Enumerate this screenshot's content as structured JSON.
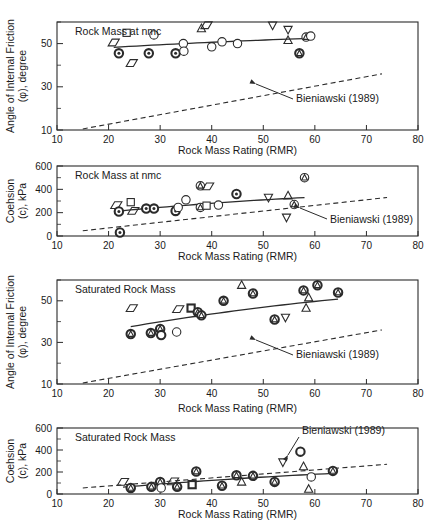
{
  "figure": {
    "xlabel": "Rock Mass Rating (RMR)",
    "xlim": [
      10,
      80
    ],
    "xticks": [
      10,
      20,
      30,
      40,
      50,
      60,
      70,
      80
    ],
    "annotation_label": "Bieniawski (1989)"
  },
  "panels": [
    {
      "id": "panel-1",
      "title": "Rock Mass at nmc",
      "ylabel_line1": "Angle of Internal Friction",
      "ylabel_line2": "(φ), degree",
      "ylim": [
        10,
        60
      ],
      "yticks": [
        10,
        30,
        50
      ],
      "yticks_minor": [
        20,
        40,
        60
      ],
      "annotation": "Bieniawski (1989)"
    },
    {
      "id": "panel-2",
      "title": "Rock Mass at nmc",
      "ylabel_line1": "Coehsion",
      "ylabel_line2": "(c), kPa",
      "ylim": [
        0,
        600
      ],
      "yticks": [
        0,
        200,
        400,
        600
      ],
      "yticks_minor": [
        100,
        300,
        500
      ],
      "annotation": "Bieniawski (1989)"
    },
    {
      "id": "panel-3",
      "title": "Saturated Rock Mass",
      "ylabel_line1": "Angle of Internal Friction",
      "ylabel_line2": "(φ), degree",
      "ylim": [
        10,
        60
      ],
      "yticks": [
        10,
        30,
        50
      ],
      "yticks_minor": [
        20,
        40,
        60
      ],
      "annotation": "Bieniawski (1989)"
    },
    {
      "id": "panel-4",
      "title": "Saturated Rock Mass",
      "ylabel_line1": "Coehsion",
      "ylabel_line2": "(c), kPa",
      "ylim": [
        0,
        600
      ],
      "yticks": [
        0,
        200,
        400,
        600
      ],
      "yticks_minor": [
        100,
        300,
        500
      ],
      "annotation": "Bieniawski (1989)"
    }
  ],
  "chart_data": [
    {
      "type": "scatter",
      "title": "Rock Mass at nmc",
      "xlabel": "Rock Mass Rating (RMR)",
      "ylabel": "Angle of Internal Friction (φ), degree",
      "xlim": [
        10,
        80
      ],
      "ylim": [
        10,
        60
      ],
      "xticks": [
        10,
        20,
        30,
        40,
        50,
        60,
        70,
        80
      ],
      "yticks": [
        10,
        30,
        50
      ],
      "grid": false,
      "legend": "none",
      "points": [
        {
          "x": 21.0,
          "y": 50.5,
          "marker": "parallelogram"
        },
        {
          "x": 23.5,
          "y": 55.0,
          "marker": "square"
        },
        {
          "x": 22.0,
          "y": 45.5,
          "marker": "circle-dot-bold"
        },
        {
          "x": 24.5,
          "y": 41.0,
          "marker": "parallelogram"
        },
        {
          "x": 28.8,
          "y": 54.0,
          "marker": "circle"
        },
        {
          "x": 27.8,
          "y": 45.5,
          "marker": "circle-dot-bold"
        },
        {
          "x": 33.0,
          "y": 45.5,
          "marker": "circle-dot-bold"
        },
        {
          "x": 34.5,
          "y": 50.0,
          "marker": "circle"
        },
        {
          "x": 34.6,
          "y": 46.5,
          "marker": "circle"
        },
        {
          "x": 38.0,
          "y": 57.0,
          "marker": "triangle-up"
        },
        {
          "x": 39.0,
          "y": 58.5,
          "marker": "parallelogram"
        },
        {
          "x": 40.0,
          "y": 48.5,
          "marker": "circle"
        },
        {
          "x": 42.0,
          "y": 50.8,
          "marker": "circle"
        },
        {
          "x": 45.0,
          "y": 50.0,
          "marker": "circle"
        },
        {
          "x": 51.8,
          "y": 58.5,
          "marker": "triangle-down"
        },
        {
          "x": 54.8,
          "y": 56.5,
          "marker": "triangle-down"
        },
        {
          "x": 54.8,
          "y": 51.5,
          "marker": "triangle-up"
        },
        {
          "x": 57.0,
          "y": 45.5,
          "marker": "circle-triangle-bold"
        },
        {
          "x": 58.3,
          "y": 53.0,
          "marker": "circle-triangle"
        },
        {
          "x": 59.2,
          "y": 53.5,
          "marker": "circle"
        }
      ],
      "fit_curve": {
        "name": "best-fit",
        "style": "solid"
      },
      "reference_line": {
        "name": "Bieniawski (1989)",
        "style": "dashed",
        "x": [
          15,
          73
        ],
        "y": [
          10.5,
          36.0
        ]
      }
    },
    {
      "type": "scatter",
      "title": "Rock Mass at nmc",
      "xlabel": "Rock Mass Rating (RMR)",
      "ylabel": "Coehsion (c), kPa",
      "xlim": [
        10,
        80
      ],
      "ylim": [
        0,
        600
      ],
      "xticks": [
        10,
        20,
        30,
        40,
        50,
        60,
        70,
        80
      ],
      "yticks": [
        0,
        200,
        400,
        600
      ],
      "grid": false,
      "legend": "none",
      "points": [
        {
          "x": 21.5,
          "y": 265,
          "marker": "parallelogram"
        },
        {
          "x": 24.3,
          "y": 290,
          "marker": "square"
        },
        {
          "x": 22.0,
          "y": 210,
          "marker": "circle-dot-bold"
        },
        {
          "x": 24.8,
          "y": 215,
          "marker": "parallelogram"
        },
        {
          "x": 22.2,
          "y": 30,
          "marker": "circle-dot-bold"
        },
        {
          "x": 27.3,
          "y": 235,
          "marker": "circle-dot-bold"
        },
        {
          "x": 28.8,
          "y": 235,
          "marker": "circle-dot-bold"
        },
        {
          "x": 33.0,
          "y": 215,
          "marker": "circle-dot-bold"
        },
        {
          "x": 33.5,
          "y": 245,
          "marker": "circle"
        },
        {
          "x": 35.0,
          "y": 310,
          "marker": "circle"
        },
        {
          "x": 37.8,
          "y": 430,
          "marker": "circle-triangle"
        },
        {
          "x": 39.3,
          "y": 425,
          "marker": "parallelogram"
        },
        {
          "x": 37.8,
          "y": 245,
          "marker": "circle-triangle"
        },
        {
          "x": 39.0,
          "y": 260,
          "marker": "square"
        },
        {
          "x": 41.3,
          "y": 265,
          "marker": "circle"
        },
        {
          "x": 44.8,
          "y": 360,
          "marker": "circle-dot-bold"
        },
        {
          "x": 51.0,
          "y": 330,
          "marker": "triangle-down"
        },
        {
          "x": 54.8,
          "y": 345,
          "marker": "triangle-up"
        },
        {
          "x": 54.5,
          "y": 160,
          "marker": "triangle-down"
        },
        {
          "x": 56.0,
          "y": 270,
          "marker": "circle-triangle"
        },
        {
          "x": 58.0,
          "y": 500,
          "marker": "circle-triangle"
        }
      ],
      "fit_curve": {
        "name": "best-fit",
        "style": "solid"
      },
      "reference_line": {
        "name": "Bieniawski (1989)",
        "style": "dashed",
        "x": [
          15,
          74
        ],
        "y": [
          45,
          330
        ]
      }
    },
    {
      "type": "scatter",
      "title": "Saturated Rock Mass",
      "xlabel": "Rock Mass Rating (RMR)",
      "ylabel": "Angle of Internal Friction (φ), degree",
      "xlim": [
        10,
        80
      ],
      "ylim": [
        10,
        60
      ],
      "xticks": [
        10,
        20,
        30,
        40,
        50,
        60,
        70,
        80
      ],
      "yticks": [
        10,
        30,
        50
      ],
      "grid": false,
      "legend": "none",
      "points": [
        {
          "x": 24.5,
          "y": 46.5,
          "marker": "parallelogram"
        },
        {
          "x": 24.3,
          "y": 34.0,
          "marker": "circle-triangle-bold"
        },
        {
          "x": 28.2,
          "y": 34.5,
          "marker": "circle-triangle-bold"
        },
        {
          "x": 30.0,
          "y": 36.5,
          "marker": "circle-triangle-bold"
        },
        {
          "x": 30.2,
          "y": 33.5,
          "marker": "circle-bold"
        },
        {
          "x": 33.2,
          "y": 35.0,
          "marker": "circle"
        },
        {
          "x": 33.5,
          "y": 46.0,
          "marker": "parallelogram"
        },
        {
          "x": 36.0,
          "y": 46.5,
          "marker": "square-bold"
        },
        {
          "x": 37.3,
          "y": 44.5,
          "marker": "circle-triangle-bold"
        },
        {
          "x": 38.0,
          "y": 43.0,
          "marker": "circle-triangle-bold"
        },
        {
          "x": 42.3,
          "y": 50.0,
          "marker": "circle-triangle-bold"
        },
        {
          "x": 45.8,
          "y": 57.5,
          "marker": "triangle-up"
        },
        {
          "x": 48.0,
          "y": 53.5,
          "marker": "circle-triangle-bold"
        },
        {
          "x": 52.2,
          "y": 41.0,
          "marker": "circle-triangle-bold"
        },
        {
          "x": 54.3,
          "y": 42.0,
          "marker": "triangle-down"
        },
        {
          "x": 57.8,
          "y": 55.0,
          "marker": "circle-triangle-bold"
        },
        {
          "x": 58.8,
          "y": 51.5,
          "marker": "triangle-up"
        },
        {
          "x": 58.3,
          "y": 46.5,
          "marker": "triangle-up"
        },
        {
          "x": 60.5,
          "y": 57.5,
          "marker": "circle-triangle-bold"
        },
        {
          "x": 64.5,
          "y": 54.0,
          "marker": "circle-triangle-bold"
        }
      ],
      "fit_curve": {
        "name": "best-fit",
        "style": "solid"
      },
      "reference_line": {
        "name": "Bieniawski (1989)",
        "style": "dashed",
        "x": [
          15,
          73
        ],
        "y": [
          10.5,
          36.0
        ]
      }
    },
    {
      "type": "scatter",
      "title": "Saturated Rock Mass",
      "xlabel": "Rock Mass Rating (RMR)",
      "ylabel": "Coehsion (c), kPa",
      "xlim": [
        10,
        80
      ],
      "ylim": [
        0,
        600
      ],
      "xticks": [
        10,
        20,
        30,
        40,
        50,
        60,
        70,
        80
      ],
      "yticks": [
        0,
        200,
        400,
        600
      ],
      "grid": false,
      "legend": "none",
      "points": [
        {
          "x": 22.8,
          "y": 110,
          "marker": "parallelogram"
        },
        {
          "x": 24.3,
          "y": 55,
          "marker": "circle-triangle-bold"
        },
        {
          "x": 28.3,
          "y": 65,
          "marker": "circle-triangle-bold"
        },
        {
          "x": 30.0,
          "y": 110,
          "marker": "circle-triangle-bold"
        },
        {
          "x": 30.2,
          "y": 55,
          "marker": "circle"
        },
        {
          "x": 32.5,
          "y": 115,
          "marker": "parallelogram"
        },
        {
          "x": 33.3,
          "y": 65,
          "marker": "circle-triangle-bold"
        },
        {
          "x": 36.2,
          "y": 85,
          "marker": "square-bold"
        },
        {
          "x": 37.0,
          "y": 205,
          "marker": "circle-triangle-bold"
        },
        {
          "x": 42.0,
          "y": 75,
          "marker": "circle-triangle-bold"
        },
        {
          "x": 44.8,
          "y": 170,
          "marker": "circle-triangle-bold"
        },
        {
          "x": 45.8,
          "y": 110,
          "marker": "triangle-up"
        },
        {
          "x": 48.0,
          "y": 165,
          "marker": "circle-triangle-bold"
        },
        {
          "x": 52.2,
          "y": 110,
          "marker": "circle-triangle-bold"
        },
        {
          "x": 53.8,
          "y": 290,
          "marker": "triangle-down"
        },
        {
          "x": 57.2,
          "y": 385,
          "marker": "circle-bold"
        },
        {
          "x": 57.8,
          "y": 250,
          "marker": "triangle-up"
        },
        {
          "x": 58.8,
          "y": 45,
          "marker": "triangle-up"
        },
        {
          "x": 59.3,
          "y": 155,
          "marker": "circle"
        },
        {
          "x": 63.5,
          "y": 210,
          "marker": "circle-triangle-bold"
        }
      ],
      "fit_curve": {
        "name": "best-fit",
        "style": "solid"
      },
      "reference_line": {
        "name": "Bieniawski (1989)",
        "style": "dashed",
        "x": [
          15,
          74
        ],
        "y": [
          55,
          270
        ]
      }
    }
  ]
}
